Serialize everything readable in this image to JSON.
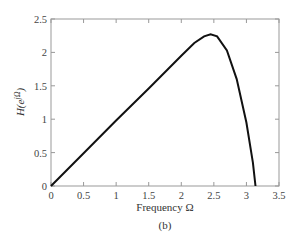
{
  "chart_data": {
    "type": "line",
    "title": "",
    "xlabel": "Frequency Ω",
    "ylabel": "H(e^{jΩ})",
    "caption": "(b)",
    "xlim": [
      0,
      3.5
    ],
    "ylim": [
      0,
      2.5
    ],
    "xticks": [
      "0",
      "0.5",
      "1",
      "1.5",
      "2",
      "2.5",
      "3",
      "3.5"
    ],
    "yticks": [
      "0",
      "0.5",
      "1",
      "1.5",
      "2",
      "2.5"
    ],
    "grid": false,
    "series": [
      {
        "name": "H(e^{jΩ})",
        "x": [
          0,
          0.5,
          1.0,
          1.5,
          2.0,
          2.2,
          2.35,
          2.45,
          2.55,
          2.7,
          2.85,
          3.0,
          3.1,
          3.14
        ],
        "y": [
          0,
          0.49,
          0.98,
          1.46,
          1.95,
          2.14,
          2.24,
          2.27,
          2.24,
          2.03,
          1.6,
          0.95,
          0.35,
          0
        ]
      }
    ]
  }
}
